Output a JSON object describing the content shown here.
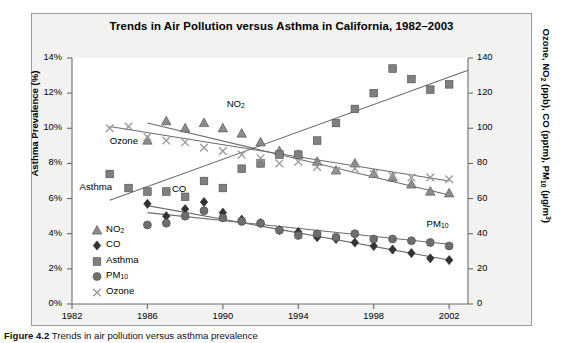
{
  "figure": {
    "caption_label": "Figure 4.2",
    "caption_text": "  Trends in air pollution versus asthma prevalence"
  },
  "chart_data": {
    "type": "scatter",
    "title": "Trends in Air Pollution versus Asthma in California, 1982–2003",
    "xlabel": "",
    "ylabel": "Asthma Prevalence (%)",
    "ylabel_right": "Ozone, NO2 (ppb), CO (pptm), PM10 (µg/m³)",
    "xlim": [
      1982,
      2003
    ],
    "ylim": [
      0,
      14
    ],
    "ylim_right": [
      0,
      140
    ],
    "xticks": [
      1982,
      1986,
      1990,
      1994,
      1998,
      2002
    ],
    "xtick_labels": [
      "1982",
      "1986",
      "1990",
      "1994",
      "1998",
      "2002"
    ],
    "yticks_left": [
      0,
      2,
      4,
      6,
      8,
      10,
      12,
      14
    ],
    "ytick_labels_left": [
      "0%",
      "2%",
      "4%",
      "6%",
      "8%",
      "10%",
      "12%",
      "14%"
    ],
    "yticks_right": [
      0,
      20,
      40,
      60,
      80,
      100,
      120,
      140
    ],
    "ytick_labels_right": [
      "0",
      "20",
      "40",
      "60",
      "80",
      "100",
      "120",
      "140"
    ],
    "grid": false,
    "legend_position": "lower-left",
    "axis": "dual-y",
    "series": [
      {
        "name": "NO2",
        "marker": "triangle",
        "color": "#8c8c8c",
        "axis": "right",
        "unit": "ppb",
        "x": [
          1986,
          1987,
          1988,
          1989,
          1990,
          1991,
          1992,
          1993,
          1994,
          1995,
          1996,
          1997,
          1998,
          1999,
          2000,
          2001,
          2002
        ],
        "y": [
          93,
          104,
          100,
          103,
          100,
          97,
          92,
          87,
          85,
          81,
          76,
          80,
          74,
          72,
          68,
          64,
          63
        ],
        "trend": {
          "x": [
            1986,
            2002
          ],
          "y": [
            103,
            62
          ]
        }
      },
      {
        "name": "CO",
        "marker": "diamond",
        "color": "#333333",
        "axis": "right",
        "unit": "pptm",
        "x": [
          1986,
          1987,
          1988,
          1989,
          1990,
          1991,
          1992,
          1993,
          1994,
          1995,
          1996,
          1997,
          1998,
          1999,
          2000,
          2001,
          2002
        ],
        "y": [
          57,
          50,
          54,
          58,
          52,
          48,
          46,
          42,
          41,
          38,
          37,
          35,
          33,
          31,
          29,
          26,
          25
        ],
        "trend": {
          "x": [
            1986,
            2002
          ],
          "y": [
            56,
            25
          ]
        }
      },
      {
        "name": "Asthma",
        "marker": "square",
        "color": "#808080",
        "axis": "left",
        "unit": "%",
        "x": [
          1984,
          1985,
          1986,
          1987,
          1988,
          1989,
          1990,
          1991,
          1992,
          1993,
          1994,
          1995,
          1996,
          1997,
          1998,
          1999,
          2000,
          2001,
          2002
        ],
        "y": [
          7.4,
          6.6,
          6.4,
          6.4,
          6.1,
          7.0,
          6.6,
          7.7,
          8.0,
          8.5,
          8.5,
          9.3,
          10.3,
          11.1,
          12.0,
          13.4,
          12.8,
          12.2,
          12.5
        ],
        "trend": {
          "x": [
            1984,
            2003
          ],
          "y": [
            5.9,
            13.3
          ]
        }
      },
      {
        "name": "PM10",
        "marker": "circle",
        "color": "#6e6e6e",
        "axis": "right",
        "unit": "µg/m³",
        "x": [
          1986,
          1987,
          1988,
          1989,
          1990,
          1991,
          1992,
          1993,
          1994,
          1995,
          1996,
          1997,
          1998,
          1999,
          2000,
          2001,
          2002
        ],
        "y": [
          45,
          46,
          50,
          53,
          49,
          47,
          46,
          42,
          39,
          40,
          38,
          40,
          37,
          37,
          36,
          35,
          33
        ],
        "trend": {
          "x": [
            1986,
            2002
          ],
          "y": [
            52,
            34
          ]
        }
      },
      {
        "name": "Ozone",
        "marker": "cross",
        "color": "#9a9a9a",
        "axis": "right",
        "unit": "ppb",
        "x": [
          1984,
          1985,
          1986,
          1987,
          1988,
          1989,
          1990,
          1991,
          1992,
          1993,
          1994,
          1995,
          1996,
          1997,
          1998,
          1999,
          2000,
          2001,
          2002
        ],
        "y": [
          100,
          101,
          95,
          93,
          92,
          89,
          87,
          85,
          83,
          80,
          81,
          78,
          76,
          77,
          74,
          73,
          72,
          72,
          71
        ],
        "trend": {
          "x": [
            1984,
            2002
          ],
          "y": [
            101,
            70
          ]
        }
      }
    ],
    "annotations": [
      {
        "text": "NO2",
        "x": 1990.2,
        "y_right": 113
      },
      {
        "text": "Ozone",
        "x": 1984.0,
        "y_right": 92
      },
      {
        "text": "Asthma",
        "x": 1982.4,
        "y_left": 6.6
      },
      {
        "text": "CO",
        "x": 1987.3,
        "y_right": 65
      },
      {
        "text": "PM10",
        "x": 2000.8,
        "y_right": 45
      }
    ]
  },
  "legend": {
    "items": [
      {
        "label": "NO2",
        "marker": "triangle"
      },
      {
        "label": "CO",
        "marker": "diamond"
      },
      {
        "label": "Asthma",
        "marker": "square"
      },
      {
        "label": "PM10",
        "marker": "circle"
      },
      {
        "label": "Ozone",
        "marker": "cross"
      }
    ]
  }
}
